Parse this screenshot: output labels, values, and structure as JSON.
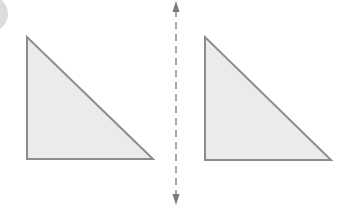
{
  "diagram": {
    "background": "#ffffff",
    "fill_color": "#ebebeb",
    "stroke_color": "#8c8c8c",
    "axis_color": "#7a7a7a",
    "corner_badge": {
      "cx": -10,
      "cy": 14,
      "r": 18,
      "fill": "#dcdcdc"
    },
    "axis_line": {
      "x": 176,
      "y1": 10,
      "y2": 196,
      "top_tip": 1,
      "bottom_tip": 205,
      "dash": "7 5",
      "orientation": "vertical",
      "arrowheads": "both"
    },
    "shapes": [
      {
        "id": "triangle-left",
        "label": "original triangle",
        "points": [
          [
            27,
            37
          ],
          [
            27,
            159
          ],
          [
            153,
            159
          ]
        ]
      },
      {
        "id": "triangle-right",
        "label": "translated triangle",
        "points": [
          [
            205,
            37
          ],
          [
            205,
            160
          ],
          [
            331,
            160
          ]
        ]
      }
    ]
  }
}
